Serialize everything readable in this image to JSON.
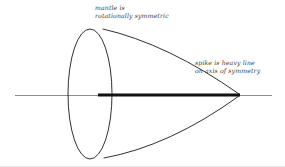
{
  "figure": {
    "background_color": "#ffffff",
    "ink_color": "#1a1a1a",
    "axis_color": "#8c8c8c",
    "text_color": "#3a3a3a",
    "border_color": "#e2e2e2",
    "width": 285,
    "height": 167
  },
  "labels": {
    "mantle": {
      "line1": "mantle is",
      "line2": "rotationally symmetric"
    },
    "spike": {
      "line1": "spike is heavy line",
      "line2": "on axis of symmetry"
    }
  },
  "geometry": {
    "axis": {
      "name": "axis of symmetry",
      "x_start": 15,
      "x_end": 272,
      "y": 95,
      "stroke_width": 1,
      "color": "#8c8c8c"
    },
    "spike": {
      "name": "spike",
      "x_start": 98,
      "x_end": 240,
      "y": 95,
      "stroke_width": 3,
      "color": "#111111"
    },
    "ellipse": {
      "name": "mantle base circle",
      "cx": 90,
      "cy": 94,
      "rx": 22,
      "ry": 65,
      "stroke_width": 0.9,
      "color": "#1a1a1a"
    },
    "mantle_upper_curve": {
      "start": [
        103,
        29
      ],
      "control": [
        168,
        44
      ],
      "end": [
        239,
        94
      ],
      "stroke_width": 0.9
    },
    "mantle_lower_curve": {
      "start": [
        104,
        158
      ],
      "control": [
        170,
        146
      ],
      "end": [
        239,
        96
      ],
      "stroke_width": 0.9
    },
    "apex": {
      "name": "cone apex",
      "x": 239,
      "y": 95
    }
  }
}
